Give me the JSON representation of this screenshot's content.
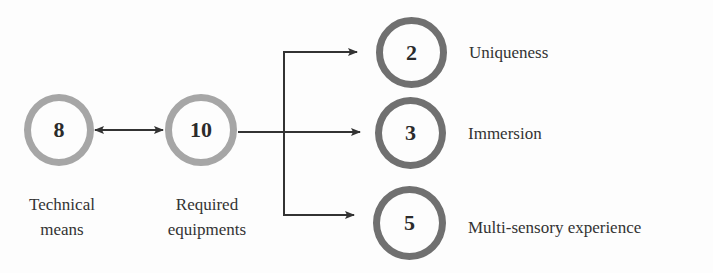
{
  "diagram": {
    "source_nodes": [
      {
        "id": "technical",
        "value": "8",
        "label_line1": "Technical",
        "label_line2": "means",
        "ring_color": "#a6a6a6"
      },
      {
        "id": "equipment",
        "value": "10",
        "label_line1": "Required",
        "label_line2": "equipments",
        "ring_color": "#a6a6a6"
      }
    ],
    "target_nodes": [
      {
        "id": "uniqueness",
        "value": "2",
        "label": "Uniqueness",
        "ring_color": "#707070"
      },
      {
        "id": "immersion",
        "value": "3",
        "label": "Immersion",
        "ring_color": "#707070"
      },
      {
        "id": "multisensory",
        "value": "5",
        "label": "Multi-sensory experience",
        "ring_color": "#707070"
      }
    ],
    "edges": [
      {
        "from": "technical",
        "to": "equipment",
        "type": "bidirectional"
      },
      {
        "from": "equipment",
        "to": "uniqueness",
        "type": "directed"
      },
      {
        "from": "equipment",
        "to": "immersion",
        "type": "directed"
      },
      {
        "from": "equipment",
        "to": "multisensory",
        "type": "directed"
      }
    ]
  }
}
